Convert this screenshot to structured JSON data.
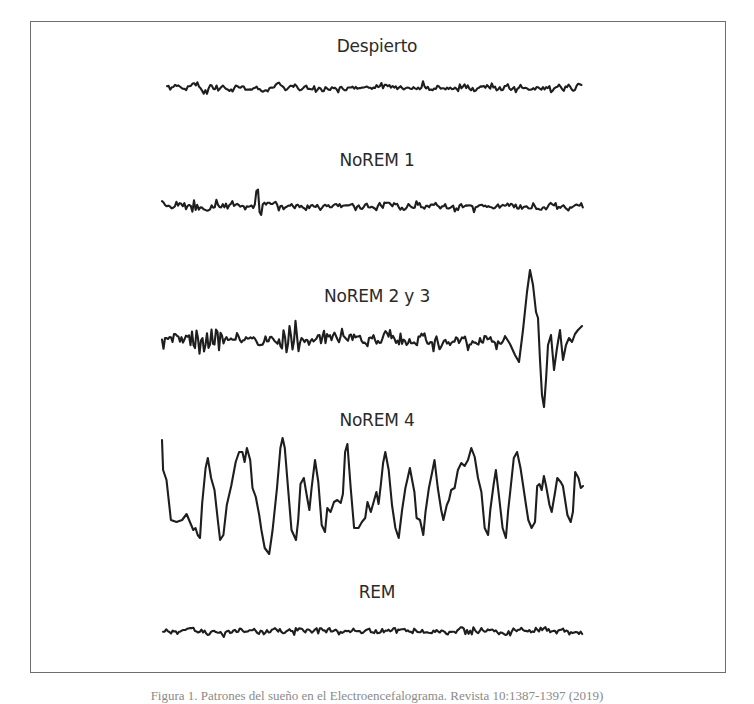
{
  "figure": {
    "stages": [
      {
        "id": "despierto",
        "title": "Despierto",
        "wave": {
          "kind": "fast-low-amplitude",
          "amplitude": "low",
          "frequency": "high"
        }
      },
      {
        "id": "norem1",
        "title": "NoREM 1",
        "wave": {
          "kind": "mixed-low-amplitude",
          "amplitude": "low",
          "frequency": "high"
        }
      },
      {
        "id": "norem23",
        "title": "NoREM 2 y 3",
        "wave": {
          "kind": "spindles-and-k-complex",
          "amplitude": "medium",
          "frequency": "mixed",
          "features": [
            "sleep spindles",
            "K-complex"
          ]
        }
      },
      {
        "id": "norem4",
        "title": "NoREM 4",
        "wave": {
          "kind": "slow-delta",
          "amplitude": "high",
          "frequency": "low"
        }
      },
      {
        "id": "rem",
        "title": "REM",
        "wave": {
          "kind": "sawtooth-low-amplitude",
          "amplitude": "low",
          "frequency": "high"
        }
      }
    ],
    "caption": "Figura 1. Patrones del sueño en el Electroencefalograma. Revista 10:1387-1397 (2019)"
  },
  "colors": {
    "trace": "#1e1e1e",
    "frame": "#6e6e6e",
    "text": "#2a2a2a",
    "background": "#ffffff"
  }
}
